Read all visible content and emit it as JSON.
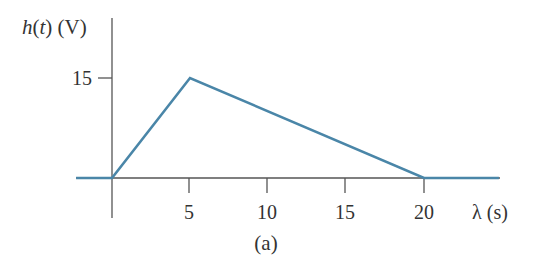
{
  "chart_data": {
    "type": "line",
    "title": "",
    "caption": "(a)",
    "xlabel": "λ (s)",
    "ylabel_func": "h",
    "ylabel_arg": "t",
    "ylabel_unit": "(V)",
    "x_ticks": [
      5,
      10,
      15,
      20
    ],
    "x_tick_labels": [
      "5",
      "10",
      "15",
      "20"
    ],
    "y_ticks": [
      15
    ],
    "y_tick_labels": [
      "15"
    ],
    "xlim": [
      -2.3,
      25
    ],
    "ylim": [
      -6,
      24
    ],
    "grid": false,
    "legend": null,
    "series": [
      {
        "name": "h(t)",
        "color": "#4a86a8",
        "x": [
          -2.3,
          0,
          5,
          20,
          24.8
        ],
        "y": [
          0,
          0,
          15,
          0,
          0
        ]
      }
    ]
  },
  "colors": {
    "axis": "#555555",
    "line": "#4a86a8",
    "text": "#333333"
  }
}
